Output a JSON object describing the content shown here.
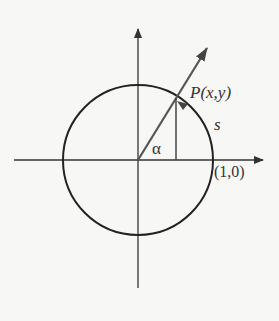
{
  "figure": {
    "colors": {
      "background": "#f7f7f5",
      "stroke": "#333333",
      "text": "#333333"
    },
    "axes": {
      "origin": [
        138,
        160
      ],
      "x_axis": {
        "from": [
          14,
          160
        ],
        "to": [
          263,
          160
        ]
      },
      "y_axis": {
        "from": [
          138,
          288
        ],
        "to": [
          138,
          28
        ]
      }
    },
    "circle": {
      "cx": 138,
      "cy": 160,
      "r": 75
    },
    "ray": {
      "from": [
        138,
        160
      ],
      "to": [
        207,
        48
      ]
    },
    "point": {
      "x": 176,
      "y": 99
    },
    "drop_line": {
      "from": [
        176,
        99
      ],
      "to": [
        176,
        160
      ]
    },
    "labels": {
      "point_label": "P(x,y)",
      "arc_label": "s",
      "angle_label": "α",
      "unit_point_label": "(1,0)"
    }
  }
}
